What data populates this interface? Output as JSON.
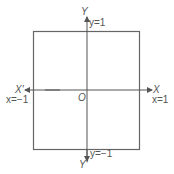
{
  "diagram": {
    "type": "coordinate-square",
    "stroke_color": "#666666",
    "square": {
      "x_min": -1,
      "x_max": 1,
      "y_min": -1,
      "y_max": 1
    },
    "labels": {
      "y_axis_pos": "Y",
      "y_axis_neg": "Y'",
      "x_axis_pos": "X",
      "x_axis_neg": "X'",
      "origin": "O",
      "top_line": "y=1",
      "bottom_line": "y=−1",
      "right_line": "x=1",
      "left_line": "x=−1"
    }
  }
}
